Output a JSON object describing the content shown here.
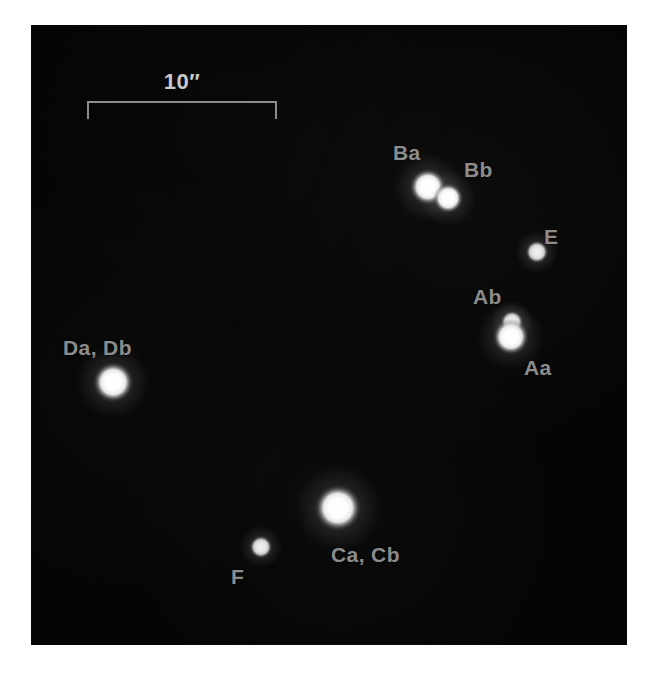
{
  "figure": {
    "type": "astronomical-image",
    "background_color": "#050505",
    "page_color": "#ffffff",
    "label_color": "#8c8c8c",
    "scale_label_color": "#c9c9c9",
    "star_color": "#ffffff"
  },
  "scale": {
    "label": "10″",
    "value": 10,
    "unit": "arcsec",
    "bar_length_px": 190,
    "style": "bracket-down-ticks"
  },
  "panel": {
    "left": 31,
    "top": 25,
    "width": 596,
    "height": 620
  },
  "sources": [
    {
      "id": "Ba",
      "label": "Ba",
      "x": 397,
      "y": 162,
      "radius": 11,
      "brightness": "bright",
      "label_x": 362,
      "label_y": 117,
      "resolved": true
    },
    {
      "id": "Bb",
      "label": "Bb",
      "x": 417,
      "y": 173,
      "radius": 9,
      "brightness": "bright",
      "label_x": 433,
      "label_y": 134,
      "resolved": true
    },
    {
      "id": "E",
      "label": "E",
      "x": 506,
      "y": 227,
      "radius": 7,
      "brightness": "faint",
      "label_x": 513,
      "label_y": 201,
      "resolved": true
    },
    {
      "id": "Ab",
      "label": "Ab",
      "x": 481,
      "y": 297,
      "radius": 7,
      "brightness": "faint",
      "label_x": 442,
      "label_y": 261,
      "resolved": true
    },
    {
      "id": "Aa",
      "label": "Aa",
      "x": 480,
      "y": 312,
      "radius": 11,
      "brightness": "bright",
      "label_x": 493,
      "label_y": 332,
      "resolved": true
    },
    {
      "id": "Da,Db",
      "label": "Da, Db",
      "x": 82,
      "y": 357,
      "radius": 12,
      "brightness": "bright",
      "label_x": 32,
      "label_y": 312,
      "resolved": false
    },
    {
      "id": "Ca,Cb",
      "label": "Ca, Cb",
      "x": 307,
      "y": 483,
      "radius": 14,
      "brightness": "bright",
      "label_x": 300,
      "label_y": 519,
      "resolved": false
    },
    {
      "id": "F",
      "label": "F",
      "x": 230,
      "y": 522,
      "radius": 7,
      "brightness": "faint",
      "label_x": 200,
      "label_y": 541,
      "resolved": true
    }
  ]
}
